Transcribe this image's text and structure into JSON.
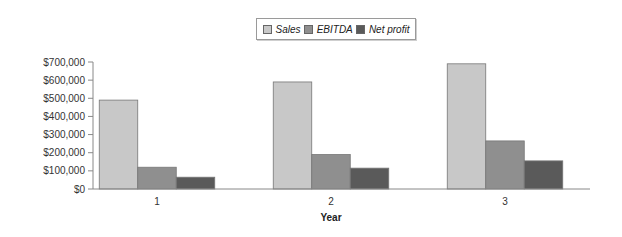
{
  "chart_data": {
    "type": "bar",
    "title": "",
    "xlabel": "Year",
    "ylabel": "",
    "categories": [
      "1",
      "2",
      "3"
    ],
    "series": [
      {
        "name": "Sales",
        "color": "#c8c8c8",
        "values": [
          490000,
          590000,
          690000
        ]
      },
      {
        "name": "EBITDA",
        "color": "#8f8f8f",
        "values": [
          120000,
          190000,
          265000
        ]
      },
      {
        "name": "Net profit",
        "color": "#5a5a5a",
        "values": [
          65000,
          115000,
          155000
        ]
      }
    ],
    "ylim": [
      0,
      700000
    ],
    "yticks": [
      "$0",
      "$100,000",
      "$200,000",
      "$300,000",
      "$400,000",
      "$500,000",
      "$600,000",
      "$700,000"
    ],
    "grid": false,
    "legend_position": "top-center"
  },
  "legend": {
    "items": [
      {
        "label": "Sales"
      },
      {
        "label": "EBITDA"
      },
      {
        "label": "Net profit"
      }
    ]
  }
}
